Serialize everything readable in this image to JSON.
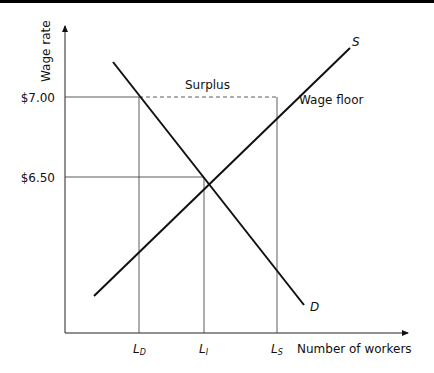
{
  "diagram": {
    "y_axis": {
      "label": "Wage rate",
      "ticks": [
        {
          "label": "$7.00",
          "value": 7.0
        },
        {
          "label": "$6.50",
          "value": 6.5
        }
      ]
    },
    "x_axis": {
      "label": "Number of workers",
      "ticks": [
        {
          "main": "L",
          "sub": "D"
        },
        {
          "main": "L",
          "sub": "I"
        },
        {
          "main": "L",
          "sub": "S"
        }
      ]
    },
    "curves": {
      "supply": {
        "label": "S"
      },
      "demand": {
        "label": "D"
      }
    },
    "annotations": {
      "surplus": "Surplus",
      "wage_floor": "Wage floor"
    },
    "colors": {
      "line": "#111111",
      "guide": "#333333",
      "top_bar": "#000000"
    }
  }
}
